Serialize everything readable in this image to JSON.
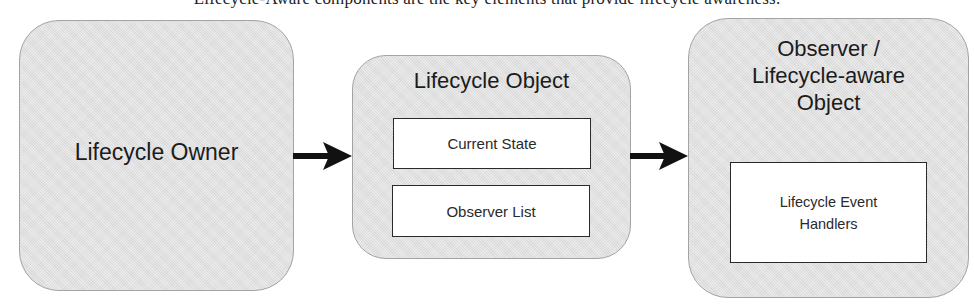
{
  "caption": {
    "text": "Lifecycle-Aware components are the key elements that provide lifecycle awareness."
  },
  "diagram": {
    "nodes": [
      {
        "id": "lifecycle-owner",
        "title": "Lifecycle Owner",
        "children": []
      },
      {
        "id": "lifecycle-object",
        "title": "Lifecycle Object",
        "children": [
          {
            "label": "Current State"
          },
          {
            "label": "Observer List"
          }
        ]
      },
      {
        "id": "observer",
        "title_lines": [
          "Observer /",
          "Lifecycle-aware",
          "Object"
        ],
        "children": [
          {
            "label_lines": [
              "Lifecycle Event",
              "Handlers"
            ]
          }
        ]
      }
    ],
    "edges": [
      {
        "from": "lifecycle-owner",
        "to": "lifecycle-object",
        "icon": "arrow-right-icon"
      },
      {
        "from": "lifecycle-object",
        "to": "observer",
        "icon": "arrow-right-icon"
      }
    ],
    "colors": {
      "box_fill": "#e4e4e4",
      "box_border": "#a3a3a3",
      "inner_fill": "#ffffff",
      "inner_border": "#2a2a2a",
      "arrow": "#111111"
    }
  }
}
